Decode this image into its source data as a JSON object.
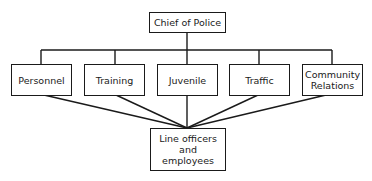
{
  "diagram": {
    "type": "org-chart",
    "top": {
      "label": "Chief of Police"
    },
    "departments": [
      {
        "label": "Personnel"
      },
      {
        "label": "Training"
      },
      {
        "label": "Juvenile"
      },
      {
        "label": "Traffic"
      },
      {
        "label": "Community Relations"
      }
    ],
    "bottom": {
      "label": "Line officers and employees"
    }
  },
  "colors": {
    "line": "#1a1a1a",
    "background": "#ffffff"
  }
}
